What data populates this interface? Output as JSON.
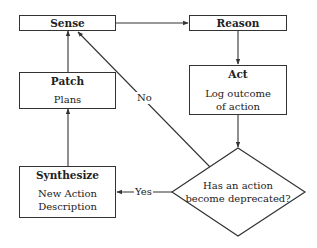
{
  "diagram": {
    "type": "flowchart",
    "nodes": {
      "sense": {
        "title": "Sense"
      },
      "reason": {
        "title": "Reason"
      },
      "act": {
        "title": "Act",
        "body_line1": "Log outcome",
        "body_line2": "of action"
      },
      "patch": {
        "title": "Patch",
        "body_line1": "Plans"
      },
      "synthesize": {
        "title": "Synthesize",
        "body_line1": "New Action",
        "body_line2": "Description"
      },
      "decision": {
        "line1": "Has an action",
        "line2": "become deprecated?"
      }
    },
    "edge_labels": {
      "no": "No",
      "yes": "Yes"
    },
    "edges": [
      {
        "from": "Sense",
        "to": "Reason"
      },
      {
        "from": "Reason",
        "to": "Act"
      },
      {
        "from": "Act",
        "to": "Has an action become deprecated?"
      },
      {
        "from": "Has an action become deprecated?",
        "to": "Sense",
        "label": "No"
      },
      {
        "from": "Has an action become deprecated?",
        "to": "Synthesize",
        "label": "Yes"
      },
      {
        "from": "Synthesize",
        "to": "Patch"
      },
      {
        "from": "Patch",
        "to": "Sense"
      }
    ],
    "colors": {
      "stroke": "#333333",
      "background": "#ffffff",
      "text": "#222222"
    }
  }
}
